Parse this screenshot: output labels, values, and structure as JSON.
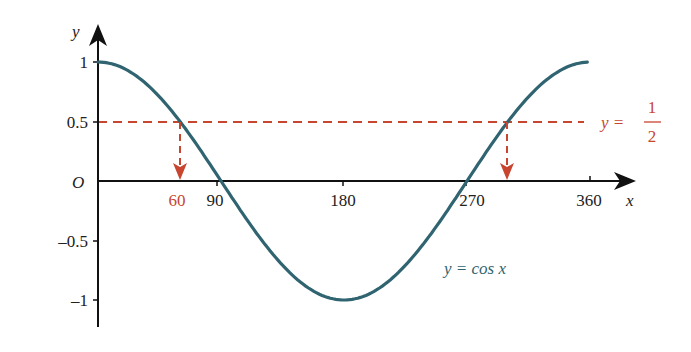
{
  "chart_data": {
    "type": "line",
    "title": "",
    "xlabel": "x",
    "ylabel": "y",
    "origin_label": "O",
    "xlim": [
      0,
      360
    ],
    "ylim": [
      -1,
      1
    ],
    "x_ticks": [
      90,
      180,
      270,
      360
    ],
    "x_tick_labels": [
      "90",
      "180",
      "270",
      "360"
    ],
    "y_ticks": [
      1,
      0.5,
      -0.5,
      -1
    ],
    "y_tick_labels": [
      "1",
      "0.5",
      "–0.5",
      "–1"
    ],
    "grid": false,
    "series": [
      {
        "name": "y = cos x",
        "color": "#2f6470",
        "x": [
          0,
          30,
          60,
          90,
          120,
          150,
          180,
          210,
          240,
          270,
          300,
          330,
          360
        ],
        "y": [
          1,
          0.866,
          0.5,
          0,
          -0.5,
          -0.866,
          -1,
          -0.866,
          -0.5,
          0,
          0.5,
          0.866,
          1
        ]
      },
      {
        "name": "y = 1/2",
        "color": "#c8452f",
        "style": "dashed",
        "x": [
          0,
          350
        ],
        "y": [
          0.5,
          0.5
        ]
      }
    ],
    "annotations": [
      {
        "type": "dashed-arrow",
        "from": [
          60,
          0.5
        ],
        "to": [
          60,
          0
        ],
        "label": "60",
        "color": "#c8452f"
      },
      {
        "type": "dashed-arrow",
        "from": [
          300,
          0.5
        ],
        "to": [
          300,
          0
        ],
        "color": "#c8452f"
      }
    ],
    "labels": {
      "cos_label": "y = cos x",
      "half_label_prefix": "y =",
      "half_num": "1",
      "half_den": "2",
      "sixty": "60"
    }
  }
}
